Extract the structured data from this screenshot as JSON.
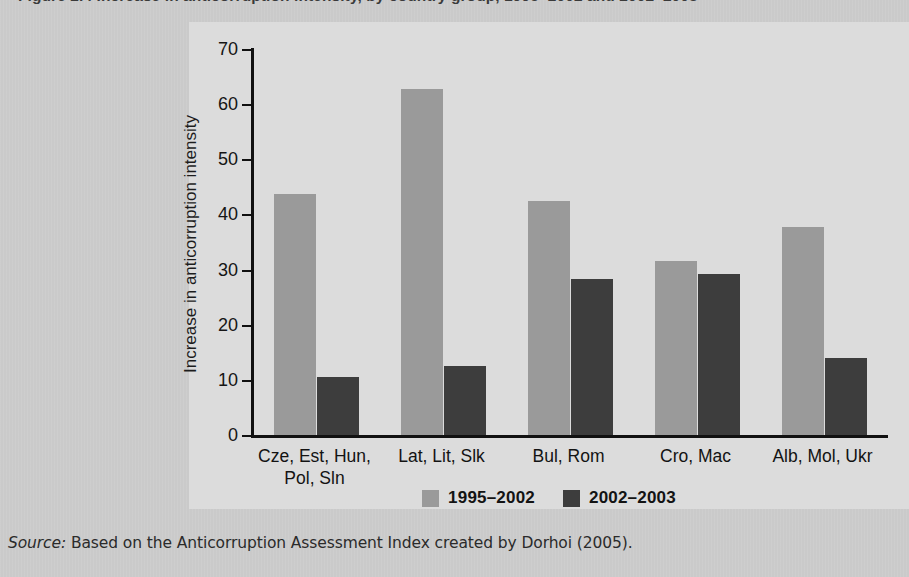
{
  "figure": {
    "title": "Figure 2.4  Increase in anticorruption intensity, by country group, 1995–2002 and 2002–2003",
    "source_lead": "Source:",
    "source_text": " Based on the Anticorruption Assessment Index created by Dorhoi (2005)."
  },
  "colors": {
    "page_background": "#cccccc",
    "plot_background": "#dcdcdc",
    "series_1995_2002": "#9a9a9a",
    "series_2002_2003": "#3d3d3d",
    "axis": "#111111",
    "text": "#131313"
  },
  "chart_data": {
    "type": "bar",
    "title": "",
    "xlabel": "",
    "ylabel": "Increase in anticorruption intensity",
    "ylim": [
      0,
      70
    ],
    "yticks": [
      0,
      10,
      20,
      30,
      40,
      50,
      60,
      70
    ],
    "ytick_labels": [
      "0",
      "10",
      "20",
      "30",
      "40",
      "50",
      "60",
      "70"
    ],
    "grid": false,
    "legend_position": "bottom-center",
    "categories": [
      "Cze, Est, Hun, Pol, Sln",
      "Lat, Lit, Slk",
      "Bul, Rom",
      "Cro, Mac",
      "Alb, Mol, Ukr"
    ],
    "category_lines": [
      [
        "Cze, Est, Hun,",
        "Pol, Sln"
      ],
      [
        "Lat, Lit, Slk",
        ""
      ],
      [
        "Bul, Rom",
        ""
      ],
      [
        "Cro, Mac",
        ""
      ],
      [
        "Alb, Mol, Ukr",
        ""
      ]
    ],
    "series": [
      {
        "name": "1995–2002",
        "color": "#9a9a9a",
        "values": [
          43.7,
          62.7,
          42.4,
          31.6,
          37.7
        ]
      },
      {
        "name": "2002–2003",
        "color": "#3d3d3d",
        "values": [
          10.5,
          12.5,
          28.3,
          29.2,
          14.0
        ]
      }
    ]
  }
}
